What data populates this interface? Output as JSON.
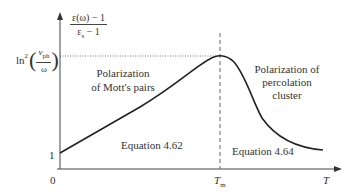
{
  "diagram": {
    "type": "line-plot-schematic",
    "y_axis_label": {
      "numerator": "ε(ω) − 1",
      "denominator_base": "ε",
      "denominator_sub": "s",
      "denominator_tail": " − 1"
    },
    "x_axis_label": "T",
    "y_ticks": {
      "one": "1",
      "max_label_prefix": "ln",
      "max_label_sup": "2",
      "max_label_num_base": "v",
      "max_label_num_sub": "ph",
      "max_label_den": "ω"
    },
    "x_ticks": {
      "origin": "0",
      "tm_base": "T",
      "tm_sub": "m"
    },
    "regions": {
      "left_title_line1": "Polarization",
      "left_title_line2": "of Mott's pairs",
      "right_title_line1": "Polarization of",
      "right_title_line2": "percolation",
      "right_title_line3": "cluster",
      "left_equation": "Equation 4.62",
      "right_equation": "Equation 4.64"
    },
    "colors": {
      "curve": "#222222",
      "axes": "#444444",
      "guides": "#666666"
    }
  }
}
